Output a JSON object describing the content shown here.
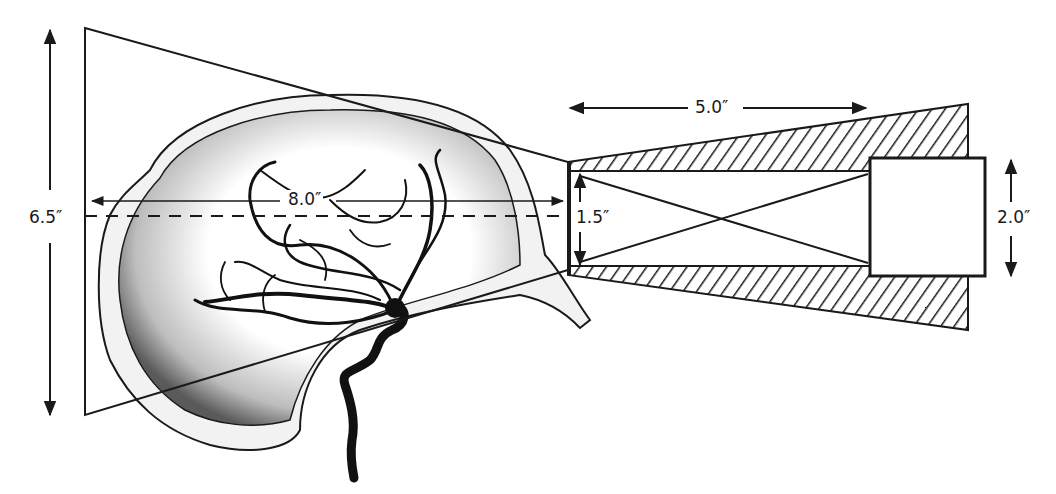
{
  "diagram": {
    "type": "geometry-schematic",
    "colors": {
      "ink": "#1a1a1a",
      "background": "#ffffff",
      "stipple": "#555555"
    },
    "labels": {
      "field_height": "6.5″",
      "object_distance": "8.0″",
      "aperture": "1.5″",
      "collimator_length": "5.0″",
      "detector_height": "2.0″"
    },
    "elements": [
      "projection-trapezoid (field of view)",
      "skull-outline with stippled brain",
      "cerebral-arteries",
      "internal-carotid-artery",
      "central-ray (dashed)",
      "collimator-with-hatched-shielding",
      "detector-box",
      "crossed-rays inside collimator"
    ]
  }
}
